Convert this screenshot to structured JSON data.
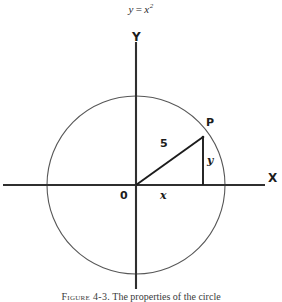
{
  "figure": {
    "title": {
      "lhs": "y",
      "operator": "=",
      "rhs_base": "x",
      "rhs_exponent": "2",
      "plain": "y = x2"
    },
    "caption": {
      "label": "Figure 4-3.",
      "text": "The properties of the circle",
      "full": "Figure 4-3. The properties of the circle"
    },
    "axes": {
      "x_label": "X",
      "y_label": "Y",
      "origin_label": "0"
    },
    "labels": {
      "point": "P",
      "radius": "5",
      "leg_vertical": "y",
      "leg_horizontal": "x"
    },
    "colors": {
      "ink": "#1c1c1c",
      "axis": "#3a3a3a",
      "circle": "#555555",
      "background": "#ffffff"
    },
    "geometry": {
      "center_x": 136,
      "center_y": 185,
      "radius_px": 89,
      "point_p_x": 203,
      "point_p_y": 137,
      "x_axis_y": 185,
      "y_axis_x": 136,
      "x_axis_start": 3,
      "x_axis_end": 265,
      "y_axis_top": 42,
      "y_axis_bottom": 288
    }
  }
}
